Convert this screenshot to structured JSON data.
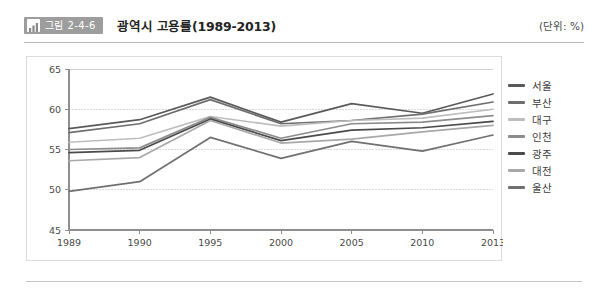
{
  "header": {
    "badge_icon": "bar-chart-icon",
    "badge_label": "그림 2-4-6",
    "title": "광역시 고용률(1989-2013)",
    "unit": "(단위: %)"
  },
  "chart_data": {
    "type": "line",
    "title": "광역시 고용률(1989-2013)",
    "xlabel": "",
    "ylabel": "",
    "unit": "%",
    "grid": true,
    "legend_position": "right",
    "categories": [
      "1989",
      "1990",
      "1995",
      "2000",
      "2005",
      "2010",
      "2013"
    ],
    "x": [
      1989,
      1990,
      1995,
      2000,
      2005,
      2010,
      2013
    ],
    "xlim": [
      1989,
      2013
    ],
    "ylim": [
      45,
      65
    ],
    "yticks": [
      45,
      50,
      55,
      60,
      65
    ],
    "series": [
      {
        "name": "서울",
        "color": "#5a5a5a",
        "values": [
          57.6,
          58.7,
          61.5,
          58.4,
          60.7,
          59.5,
          61.9
        ]
      },
      {
        "name": "부산",
        "color": "#6e6e6e",
        "values": [
          57.1,
          58.2,
          61.2,
          58.2,
          58.6,
          59.4,
          60.9
        ]
      },
      {
        "name": "대구",
        "color": "#bdbdbd",
        "values": [
          55.9,
          56.4,
          59.1,
          57.9,
          58.6,
          58.9,
          60.0
        ]
      },
      {
        "name": "인천",
        "color": "#8c8c8c",
        "values": [
          55.0,
          55.2,
          59.0,
          56.4,
          58.2,
          58.4,
          59.2
        ]
      },
      {
        "name": "광주",
        "color": "#4a4a4a",
        "values": [
          54.6,
          54.9,
          58.8,
          56.1,
          57.4,
          57.7,
          58.5
        ]
      },
      {
        "name": "대전",
        "color": "#a8a8a8",
        "values": [
          53.6,
          54.0,
          58.6,
          55.8,
          56.3,
          57.2,
          58.0
        ]
      },
      {
        "name": "울산",
        "color": "#707070",
        "values": [
          49.8,
          51.0,
          56.5,
          53.9,
          56.0,
          54.8,
          56.8
        ]
      }
    ]
  }
}
